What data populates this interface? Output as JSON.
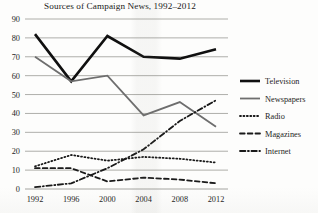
{
  "chart_data": {
    "type": "line",
    "title": "Sources of Campaign News, 1992–2012",
    "xlabel": "",
    "ylabel": "",
    "categories": [
      "1992",
      "1996",
      "2000",
      "2004",
      "2008",
      "2012"
    ],
    "x": [
      1992,
      1996,
      2000,
      2004,
      2008,
      2012
    ],
    "xlim": [
      1992,
      2012
    ],
    "ylim": [
      0,
      90
    ],
    "yticks": [
      0,
      10,
      20,
      30,
      40,
      50,
      60,
      70,
      80,
      90
    ],
    "grid": true,
    "legend_position": "right",
    "series": [
      {
        "name": "Television",
        "values": [
          82,
          57,
          81,
          70,
          69,
          74
        ],
        "color": "#101010",
        "style": "solid",
        "width": 2.6
      },
      {
        "name": "Newspapers",
        "values": [
          70,
          57,
          60,
          39,
          46,
          33
        ],
        "color": "#6e6e6e",
        "style": "solid",
        "width": 1.8
      },
      {
        "name": "Radio",
        "values": [
          12,
          18,
          15,
          17,
          16,
          14
        ],
        "color": "#1a1a1a",
        "style": "dotted",
        "width": 1.8
      },
      {
        "name": "Magazines",
        "values": [
          11,
          11,
          4,
          6,
          5,
          3
        ],
        "color": "#1a1a1a",
        "style": "dashed",
        "width": 1.8
      },
      {
        "name": "Internet",
        "values": [
          1,
          3,
          11,
          21,
          36,
          47
        ],
        "color": "#1a1a1a",
        "style": "dashdot",
        "width": 1.8
      }
    ]
  },
  "axis": {
    "y_labels": [
      "90",
      "80",
      "70",
      "60",
      "50",
      "40",
      "30",
      "20",
      "10",
      "0"
    ],
    "x_labels": [
      "1992",
      "1996",
      "2000",
      "2004",
      "2008",
      "2012"
    ]
  },
  "legend": {
    "items": [
      {
        "label": "Television"
      },
      {
        "label": "Newspapers"
      },
      {
        "label": "Radio"
      },
      {
        "label": "Magazines"
      },
      {
        "label": "Internet"
      }
    ]
  }
}
